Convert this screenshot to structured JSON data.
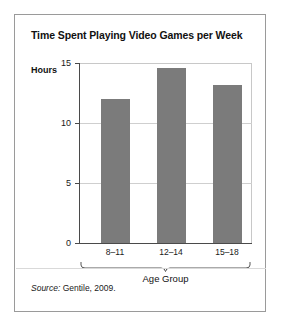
{
  "figure": {
    "title": "Time Spent Playing Video Games per Week",
    "source_label": "Source:",
    "source_text": "Gentile, 2009.",
    "bar_color": "#7b7b7b",
    "frame_color": "#9a9a9a",
    "grid_color": "#cfcfcf",
    "axis_color": "#4a4a4a"
  },
  "chart_data": {
    "type": "bar",
    "title": "Time Spent Playing Video Games per Week",
    "categories": [
      "8–11",
      "12–14",
      "15–18"
    ],
    "values": [
      12.0,
      14.6,
      13.2
    ],
    "series": [
      {
        "name": "Hours per week",
        "values": [
          12.0,
          14.6,
          13.2
        ]
      }
    ],
    "xlabel": "Age Group",
    "ylabel": "Hours",
    "ylim": [
      0,
      15
    ],
    "yticks": [
      0,
      5,
      10,
      15
    ],
    "ytick_labels": [
      "0",
      "5",
      "10",
      "15"
    ],
    "grid": true,
    "grid_axis": "y",
    "legend": false,
    "legend_position": "none",
    "annotations": [
      "Source: Gentile, 2009."
    ],
    "bar_color": "#7b7b7b",
    "orientation": "vertical"
  }
}
